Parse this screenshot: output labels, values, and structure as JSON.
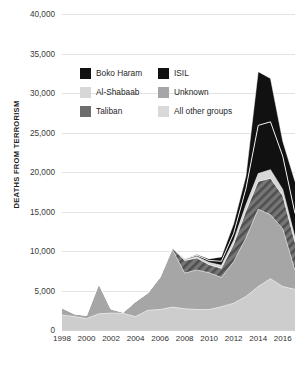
{
  "chart_data": {
    "type": "area",
    "title": "",
    "subtitle": "",
    "xlabel": "",
    "ylabel": "DEATHS FROM TERRORISM",
    "stacked": true,
    "grid": true,
    "legend_position": "top-center",
    "xlim": [
      1998,
      2017
    ],
    "ylim": [
      0,
      40000
    ],
    "yticks": [
      0,
      5000,
      10000,
      15000,
      20000,
      25000,
      30000,
      35000,
      40000
    ],
    "ytick_labels": [
      "0",
      "5,000",
      "10,000",
      "15,000",
      "20,000",
      "25,000",
      "30,000",
      "35,000",
      "40,000"
    ],
    "xticks": [
      1998,
      2000,
      2002,
      2004,
      2006,
      2008,
      2010,
      2012,
      2014,
      2016
    ],
    "xtick_labels": [
      "1998",
      "2000",
      "2002",
      "2004",
      "2006",
      "2008",
      "2010",
      "2012",
      "2014",
      "2016"
    ],
    "x": [
      1998,
      1999,
      2000,
      2001,
      2002,
      2003,
      2004,
      2005,
      2006,
      2007,
      2008,
      2009,
      2010,
      2011,
      2012,
      2013,
      2014,
      2015,
      2016,
      2017
    ],
    "series": [
      {
        "name": "All other groups",
        "color": "#cdcdcd",
        "pattern": "solid",
        "stack_order": 1,
        "values": [
          1900,
          1700,
          1450,
          2050,
          2150,
          2100,
          1700,
          2500,
          2600,
          2900,
          2700,
          2600,
          2600,
          2950,
          3400,
          4250,
          5500,
          6500,
          5500,
          5150
        ]
      },
      {
        "name": "Unknown",
        "color": "#a6a6a6",
        "pattern": "solid",
        "stack_order": 2,
        "values": [
          900,
          350,
          400,
          3800,
          500,
          150,
          1900,
          2200,
          4100,
          7300,
          4500,
          5000,
          4650,
          3700,
          5250,
          7400,
          9800,
          8100,
          7300,
          2400
        ]
      },
      {
        "name": "Taliban",
        "color": "#6e6e6e",
        "pattern": "diagonal-hatch",
        "stack_order": 3,
        "values": [
          0,
          0,
          0,
          0,
          0,
          0,
          0,
          0,
          0,
          200,
          1600,
          1500,
          1000,
          1150,
          2200,
          3400,
          3500,
          4600,
          4200,
          3500
        ]
      },
      {
        "name": "Al-Shabaab",
        "color": "#d7d7d7",
        "pattern": "solid",
        "stack_order": 4,
        "values": [
          0,
          0,
          0,
          0,
          0,
          0,
          0,
          0,
          0,
          0,
          100,
          200,
          300,
          400,
          500,
          800,
          1000,
          1100,
          800,
          700
        ]
      },
      {
        "name": "ISIL",
        "color": "#111111",
        "pattern": "solid",
        "stack_order": 5,
        "values": [
          0,
          0,
          0,
          0,
          0,
          0,
          0,
          0,
          0,
          0,
          100,
          150,
          250,
          500,
          900,
          2050,
          6100,
          6050,
          4200,
          3000
        ]
      },
      {
        "name": "Boko Haram",
        "color": "#111111",
        "pattern": "solid",
        "stack_order": 6,
        "values": [
          0,
          0,
          0,
          0,
          0,
          0,
          0,
          0,
          0,
          0,
          0,
          100,
          200,
          550,
          1200,
          1600,
          6800,
          5500,
          1900,
          4050
        ]
      }
    ],
    "totals": [
      2800,
      2050,
      1850,
      5850,
      2650,
      2250,
      3600,
      4700,
      6700,
      10400,
      9000,
      9550,
      9000,
      9250,
      13450,
      19500,
      32700,
      31850,
      23900,
      18800
    ],
    "peak": {
      "year": 2014,
      "value": 32700
    }
  },
  "legend": {
    "rows": [
      [
        {
          "label": "Boko Haram",
          "swatch": "boko-haram-swatch"
        },
        {
          "label": "ISIL",
          "swatch": "isil-swatch"
        }
      ],
      [
        {
          "label": "Al-Shabaab",
          "swatch": "al-shabaab-swatch"
        },
        {
          "label": "Unknown",
          "swatch": "unknown-swatch"
        }
      ],
      [
        {
          "label": "Taliban",
          "swatch": "taliban-swatch"
        },
        {
          "label": "All other groups",
          "swatch": "all-other-groups-swatch"
        }
      ]
    ],
    "labels": {
      "boko_haram": "Boko Haram",
      "isil": "ISIL",
      "al_shabaab": "Al-Shabaab",
      "unknown": "Unknown",
      "taliban": "Taliban",
      "all_other_groups": "All other groups"
    }
  },
  "axis": {
    "y_title": "DEATHS FROM TERRORISM",
    "y_labels": [
      "40,000",
      "35,000",
      "30,000",
      "25,000",
      "20,000",
      "15,000",
      "10,000",
      "5,000",
      "0"
    ],
    "x_labels": [
      "1998",
      "2000",
      "2002",
      "2004",
      "2006",
      "2008",
      "2010",
      "2012",
      "2014",
      "2016"
    ]
  },
  "colors": {
    "background": "#ffffff",
    "gridline": "#e3e3e3",
    "text": "#2b2b2b",
    "boko_haram": "#111111",
    "isil": "#111111",
    "al_shabaab": "#d7d7d7",
    "unknown": "#a6a6a6",
    "taliban": "#6e6e6e",
    "all_other_groups": "#cdcdcd"
  }
}
